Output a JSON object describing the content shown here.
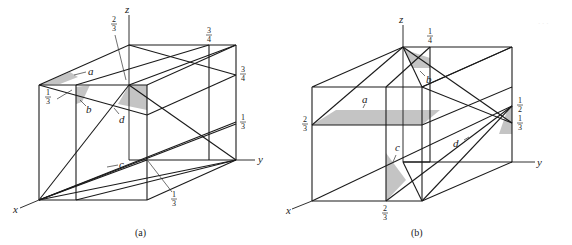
{
  "figure": {
    "panels": [
      {
        "caption": "(a)",
        "axes": {
          "x": "x",
          "y": "y",
          "z": "z"
        },
        "plane_labels": [
          "a",
          "b",
          "c",
          "d"
        ],
        "fractions": {
          "top_left_z": {
            "num": "2",
            "den": "3"
          },
          "back_top_y": {
            "num": "3",
            "den": "4"
          },
          "right_z_upper": {
            "num": "3",
            "den": "4"
          },
          "left_x": {
            "num": "1",
            "den": "3"
          },
          "right_z_lower": {
            "num": "1",
            "den": "3"
          },
          "bottom_y": {
            "num": "1",
            "den": "3"
          }
        }
      },
      {
        "caption": "(b)",
        "axes": {
          "x": "x",
          "y": "y",
          "z": "z"
        },
        "plane_labels": [
          "a",
          "b",
          "c",
          "d"
        ],
        "fractions": {
          "top_y": {
            "num": "1",
            "den": "4"
          },
          "left_z": {
            "num": "2",
            "den": "3"
          },
          "right_z_upper": {
            "num": "1",
            "den": "2"
          },
          "right_z_lower": {
            "num": "1",
            "den": "3"
          },
          "bottom_x": {
            "num": "2",
            "den": "3"
          }
        }
      }
    ],
    "corner_mark": "· · ·"
  }
}
